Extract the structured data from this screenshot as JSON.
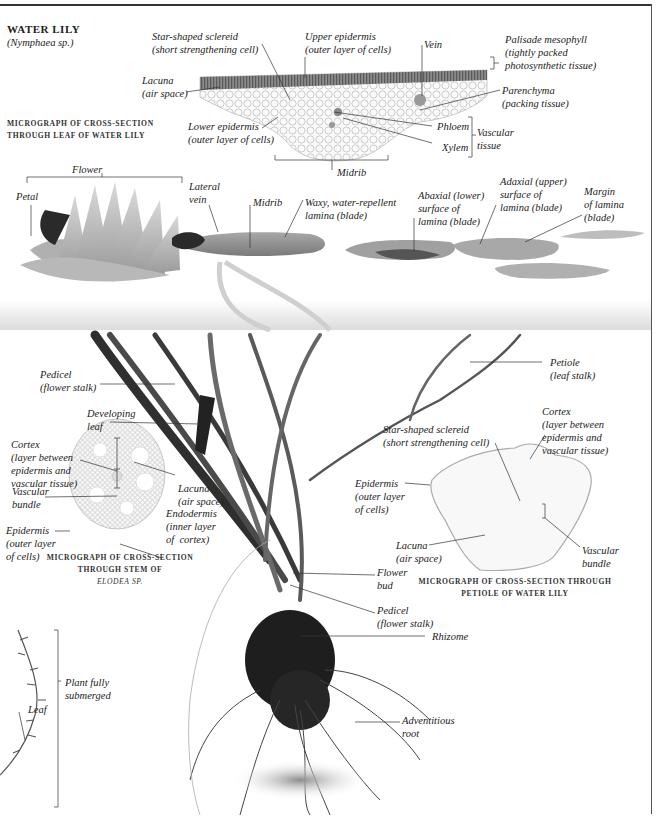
{
  "title": "WATER LILY",
  "subtitle": "(Nymphaea sp.)",
  "colors": {
    "ink": "#222222",
    "leader_line": "#333333",
    "micrograph_tissue": "#9a9a9a",
    "lily_leaf": "#8a8a8a",
    "stalk_dark": "#3a3a3a",
    "background": "#ffffff"
  },
  "leaf_micrograph": {
    "caption_line1": "MICROGRAPH OF CROSS-SECTION",
    "caption_line2": "THROUGH LEAF OF WATER LILY",
    "labels": {
      "sclereid": "Star-shaped sclereid\n(short strengthening cell)",
      "upper_epidermis": "Upper epidermis\n(outer layer of cells)",
      "vein": "Vein",
      "palisade": "Palisade mesophyll\n(tightly packed\nphotosynthetic tissue)",
      "lacuna": "Lacuna\n(air space)",
      "parenchyma": "Parenchyma\n(packing tissue)",
      "lower_epidermis": "Lower epidermis\n(outer layer of cells)",
      "phloem": "Phloem",
      "xylem": "Xylem",
      "vascular_tissue": "Vascular\ntissue",
      "midrib": "Midrib"
    }
  },
  "plant_surface": {
    "labels": {
      "flower": "Flower",
      "petal": "Petal",
      "lateral_vein": "Lateral\nvein",
      "midrib": "Midrib",
      "waxy_lamina": "Waxy, water-repellent\nlamina (blade)",
      "abaxial": "Abaxial (lower)\nsurface of\nlamina (blade)",
      "adaxial": "Adaxial (upper)\nsurface of\nlamina (blade)",
      "margin": "Margin\nof lamina\n(blade)"
    }
  },
  "underwater": {
    "labels": {
      "pedicel_top": "Pedicel\n(flower stalk)",
      "developing_leaf": "Developing\nleaf",
      "petiole": "Petiole\n(leaf stalk)",
      "flower_bud": "Flower\nbud",
      "pedicel_bottom": "Pedicel\n(flower stalk)",
      "rhizome": "Rhizome",
      "adventitious_root": "Adventitious\nroot"
    }
  },
  "elodea_micrograph": {
    "caption_line1": "MICROGRAPH OF CROSS-SECTION",
    "caption_line2": "THROUGH STEM OF",
    "caption_line3": "ELODEA SP.",
    "labels": {
      "cortex": "Cortex\n(layer between\nepidermis and\nvascular tissue)",
      "vascular_bundle": "Vascular\nbundle",
      "epidermis": "Epidermis\n(outer layer\nof cells)",
      "lacuna": "Lacuna\n(air space)",
      "endodermis": "Endodermis\n(inner layer\nof  cortex)"
    }
  },
  "elodea_plant": {
    "labels": {
      "submerged": "Plant fully\nsubmerged",
      "leaf": "Leaf"
    }
  },
  "petiole_micrograph": {
    "caption_line1": "MICROGRAPH OF CROSS-SECTION THROUGH",
    "caption_line2": "PETIOLE OF WATER LILY",
    "labels": {
      "sclereid": "Star-shaped sclereid\n(short strengthening cell)",
      "cortex": "Cortex\n(layer between\nepidermis and\nvascular tissue)",
      "epidermis": "Epidermis\n(outer layer\nof cells)",
      "lacuna": "Lacuna\n(air space)",
      "vascular_bundle": "Vascular\nbundle"
    }
  }
}
